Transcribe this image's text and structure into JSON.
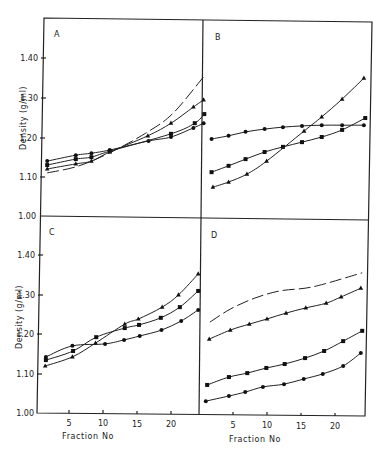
{
  "chart_data": [
    {
      "panel": "A",
      "type": "line",
      "xlabel": "",
      "ylabel": "Density (g/ml)",
      "ylim": [
        1.0,
        1.48
      ],
      "xlim": [
        0,
        24
      ],
      "yticks": [
        "1.00",
        "1.10",
        "1.20",
        "1.30",
        "1.40"
      ],
      "series": [
        {
          "name": "circles",
          "marker": "circle",
          "x": [
            1.5,
            5.7,
            8,
            10.7,
            16.4,
            19.7,
            23,
            24.5
          ],
          "y": [
            1.139,
            1.154,
            1.159,
            1.167,
            1.19,
            1.2,
            1.223,
            1.235
          ]
        },
        {
          "name": "squares",
          "marker": "square",
          "x": [
            1.5,
            5.7,
            8,
            10.7,
            19.7,
            23.2,
            24.6
          ],
          "y": [
            1.129,
            1.144,
            1.149,
            1.164,
            1.208,
            1.235,
            1.258
          ]
        },
        {
          "name": "triangles",
          "marker": "triangle",
          "x": [
            1.5,
            5.7,
            8,
            10.7,
            16.3,
            19.7,
            23,
            24.5
          ],
          "y": [
            1.119,
            1.132,
            1.139,
            1.162,
            1.203,
            1.235,
            1.276,
            1.294
          ]
        },
        {
          "name": "dashed",
          "marker": "none",
          "x": [
            1.5,
            6,
            10.7,
            16,
            20,
            24.7
          ],
          "y": [
            1.109,
            1.126,
            1.16,
            1.21,
            1.26,
            1.357
          ]
        }
      ]
    },
    {
      "panel": "B",
      "type": "line",
      "xlabel": "",
      "ylabel": "",
      "ylim": [
        1.0,
        1.48
      ],
      "xlim": [
        0,
        24
      ],
      "series": [
        {
          "name": "circles",
          "marker": "circle",
          "x": [
            1.7,
            4.2,
            6.7,
            9.5,
            12.2,
            15,
            17.9,
            20.9,
            24.1
          ],
          "y": [
            1.195,
            1.203,
            1.213,
            1.22,
            1.225,
            1.228,
            1.23,
            1.23,
            1.23
          ]
        },
        {
          "name": "squares",
          "marker": "square",
          "x": [
            1.7,
            4.2,
            6.7,
            9.5,
            12.2,
            15,
            17.9,
            20.9,
            24.3
          ],
          "y": [
            1.111,
            1.127,
            1.144,
            1.162,
            1.175,
            1.187,
            1.2,
            1.218,
            1.248
          ]
        },
        {
          "name": "triangles",
          "marker": "triangle",
          "x": [
            1.9,
            4.2,
            6.9,
            9.8,
            15.3,
            17.9,
            20.9,
            24.1
          ],
          "y": [
            1.073,
            1.086,
            1.106,
            1.139,
            1.215,
            1.251,
            1.296,
            1.349
          ]
        }
      ]
    },
    {
      "panel": "C",
      "type": "line",
      "xlabel": "Fraction No",
      "ylabel": "Density (g/ml)",
      "ylim": [
        1.0,
        1.48
      ],
      "xlim": [
        0,
        24
      ],
      "xticks": [
        "5",
        "10",
        "15",
        "20"
      ],
      "yticks": [
        "1.00",
        "1.10",
        "1.20",
        "1.30",
        "1.40"
      ],
      "series": [
        {
          "name": "circles",
          "marker": "circle",
          "x": [
            1.6,
            5.5,
            10.3,
            13.1,
            15.4,
            18.6,
            21.5,
            24
          ],
          "y": [
            1.142,
            1.17,
            1.175,
            1.185,
            1.195,
            1.21,
            1.233,
            1.261
          ]
        },
        {
          "name": "squares",
          "marker": "square",
          "x": [
            1.6,
            5.6,
            9,
            13.2,
            15.3,
            18.5,
            21.3,
            24
          ],
          "y": [
            1.134,
            1.157,
            1.192,
            1.215,
            1.223,
            1.241,
            1.268,
            1.309
          ]
        },
        {
          "name": "triangles",
          "marker": "triangle",
          "x": [
            1.5,
            5.5,
            8.9,
            13.2,
            15.2,
            18.7,
            21.1,
            24
          ],
          "y": [
            1.119,
            1.142,
            1.177,
            1.225,
            1.238,
            1.268,
            1.299,
            1.352
          ]
        }
      ]
    },
    {
      "panel": "D",
      "type": "line",
      "xlabel": "Fraction No",
      "ylabel": "",
      "ylim": [
        1.0,
        1.48
      ],
      "xlim": [
        0,
        24
      ],
      "xticks": [
        "5",
        "10",
        "15",
        "20"
      ],
      "series": [
        {
          "name": "circles",
          "marker": "circle",
          "x": [
            1,
            4.4,
            6.8,
            9.4,
            12.5,
            15.4,
            18.2,
            21.2,
            23.8
          ],
          "y": [
            1.03,
            1.043,
            1.053,
            1.066,
            1.073,
            1.086,
            1.099,
            1.119,
            1.152
          ]
        },
        {
          "name": "squares",
          "marker": "square",
          "x": [
            1.2,
            4.4,
            7.1,
            9.9,
            12.6,
            15.6,
            18.4,
            21.2,
            24
          ],
          "y": [
            1.071,
            1.091,
            1.101,
            1.114,
            1.124,
            1.139,
            1.157,
            1.182,
            1.208
          ]
        },
        {
          "name": "triangles",
          "marker": "triangle",
          "x": [
            1.5,
            4.6,
            7.4,
            10,
            12.8,
            15.7,
            18.7,
            20.9,
            23.8
          ],
          "y": [
            1.187,
            1.21,
            1.225,
            1.238,
            1.253,
            1.266,
            1.278,
            1.294,
            1.316
          ]
        },
        {
          "name": "dashed",
          "marker": "none",
          "x": [
            1.6,
            4.6,
            8.2,
            11.9,
            15.6,
            18.5,
            24
          ],
          "y": [
            1.23,
            1.263,
            1.291,
            1.309,
            1.316,
            1.327,
            1.355
          ]
        }
      ]
    }
  ],
  "labels": {
    "panel_a": "A",
    "panel_b": "B",
    "panel_c": "C",
    "panel_d": "D",
    "ylabel_top": "Density (g/ml)",
    "ylabel_bottom": "Density (g/ml)",
    "xlabel_left": "Fraction No",
    "xlabel_right": "Fraction No",
    "ytick_140": "1.40",
    "ytick_130": "1.30",
    "ytick_120": "1.20",
    "ytick_110": "1.10",
    "ytick_100": "1.00",
    "xtick_5": "5",
    "xtick_10": "10",
    "xtick_15": "15",
    "xtick_20": "20"
  }
}
